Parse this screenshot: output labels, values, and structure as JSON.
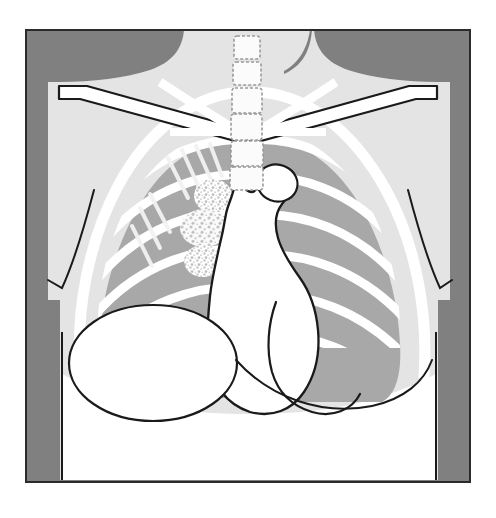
{
  "figure": {
    "type": "medical-illustration",
    "modality": "chest-radiograph-pa",
    "caption": "",
    "width": 496,
    "height": 518
  },
  "canvas": {
    "page_background": "#ffffff",
    "plate_left": 26,
    "plate_top": 30,
    "plate_width": 444,
    "plate_height": 452
  },
  "palette": {
    "page_white": "#ffffff",
    "background_dark_gray": "#808080",
    "soft_tissue_light_gray": "#e4e4e4",
    "lung_field_gray": "#a8a8a8",
    "bone_white": "#ffffff",
    "outline_black": "#1a1a1a",
    "lesion_speckle": "#d8d8d8",
    "plate_border": "#2b2b2b"
  },
  "structures": {
    "background_label": "radiograph background",
    "neck_label": "neck soft tissue",
    "shoulder_left_label": "left shoulder soft tissue",
    "shoulder_right_label": "right shoulder soft tissue",
    "thorax_label": "thoracic soft tissue silhouette",
    "lung_right_label": "right lung field",
    "lung_left_label": "left lung field",
    "spine_label": "thoracic vertebral column",
    "clavicle_left_label": "left clavicle",
    "clavicle_right_label": "right clavicle",
    "ribs_label": "rib cage",
    "mediastinum_label": "mediastinum and cardiac silhouette",
    "aortic_knob_label": "aortic knob",
    "heart_border_left_label": "left heart border",
    "diaphragm_right_label": "elevated right hemidiaphragm",
    "lesion_label": "pulmonary infiltrate opacity",
    "abdomen_label": "sub-diaphragmatic abdomen",
    "breast_shadow_left_label": "left chest wall soft tissue line",
    "breast_shadow_right_label": "right chest wall soft tissue line"
  },
  "spine": {
    "count": 6,
    "vertebrae": [
      {
        "index": 1,
        "x": 234,
        "y": 36,
        "w": 26,
        "h": 23
      },
      {
        "index": 2,
        "x": 233,
        "y": 62,
        "w": 28,
        "h": 23
      },
      {
        "index": 3,
        "x": 232,
        "y": 88,
        "w": 30,
        "h": 25
      },
      {
        "index": 4,
        "x": 231,
        "y": 114,
        "w": 31,
        "h": 26
      },
      {
        "index": 5,
        "x": 231,
        "y": 141,
        "w": 32,
        "h": 25
      },
      {
        "index": 6,
        "x": 230,
        "y": 167,
        "w": 33,
        "h": 23
      }
    ]
  },
  "ribs": {
    "right_count": 7,
    "left_count": 7,
    "posterior_count_right": 6
  },
  "lesions": [
    {
      "index": 1,
      "cx": 213,
      "cy": 196,
      "rx": 19,
      "ry": 17,
      "label": "upper infiltrate"
    },
    {
      "index": 2,
      "cx": 204,
      "cy": 228,
      "rx": 24,
      "ry": 19,
      "label": "mid infiltrate"
    },
    {
      "index": 3,
      "cx": 203,
      "cy": 261,
      "rx": 19,
      "ry": 16,
      "label": "lower infiltrate"
    }
  ],
  "diaphragm": {
    "cx": 153,
    "cy": 363,
    "rx": 84,
    "ry": 58,
    "label": "right hemidiaphragm dome"
  }
}
